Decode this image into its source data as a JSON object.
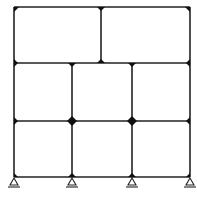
{
  "diagram": {
    "type": "structural-frame",
    "colors": {
      "member": "#222222",
      "joint": "#111111",
      "background": "#ffffff"
    },
    "columns_x": [
      14,
      72,
      132,
      190
    ],
    "levels_y": [
      7,
      63,
      121,
      177
    ],
    "top_storey_interior_column_x": 101,
    "supports": [
      {
        "x": 14,
        "type": "pin"
      },
      {
        "x": 72,
        "type": "pin"
      },
      {
        "x": 132,
        "type": "pin"
      },
      {
        "x": 190,
        "type": "pin"
      }
    ]
  }
}
